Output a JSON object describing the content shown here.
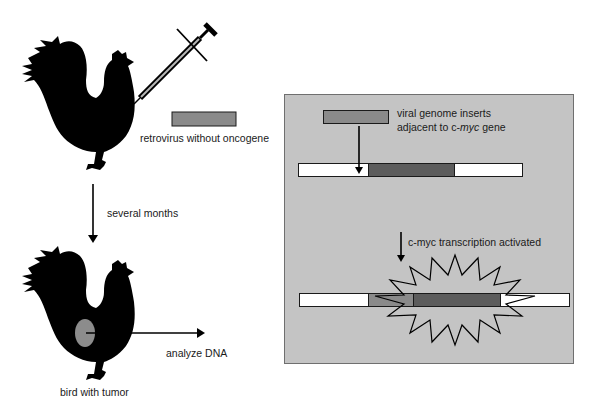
{
  "left": {
    "legend_label": "retrovirus without oncogene",
    "step_label": "several months",
    "bottom_caption": "bird with tumor",
    "action_label": "analyze DNA"
  },
  "panel": {
    "insert_label_line1": "viral genome inserts",
    "insert_label_line2_prefix": "adjacent to c-",
    "insert_label_line2_italic": "myc",
    "insert_label_line2_suffix": " gene",
    "activation_label": "c-myc transcription activated"
  },
  "colors": {
    "virus_segment": "#8a8a8a",
    "cmyc_segment": "#5c5c5c",
    "panel_bg": "#c4c4c4",
    "tumor": "#8c8c8c",
    "silhouette": "#000000"
  },
  "icons": {
    "rooster": "rooster-silhouette",
    "syringe": "syringe",
    "starburst": "activation-burst"
  }
}
